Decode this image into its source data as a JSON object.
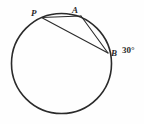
{
  "figure": {
    "background_color": "#fefefe",
    "stroke_color": "#2b2b2b",
    "circle": {
      "name": "main-circle",
      "center_x": 61.5,
      "center_y": 63.5,
      "radius": 50,
      "stroke_width": 1.6
    },
    "points": [
      {
        "id": "P",
        "label": "P",
        "x": 41.5,
        "y": 17.5,
        "label_x": 31,
        "label_y": 9
      },
      {
        "id": "A",
        "label": "A",
        "x": 81.0,
        "y": 16.0,
        "label_x": 72,
        "label_y": 6
      },
      {
        "id": "B",
        "label": "B",
        "x": 108.0,
        "y": 53.0,
        "label_x": 111,
        "label_y": 49
      }
    ],
    "chords": [
      {
        "name": "chord-p-a",
        "from": "P",
        "to": "A",
        "stroke_width": 1.1
      },
      {
        "name": "chord-p-b",
        "from": "P",
        "to": "B",
        "stroke_width": 1.1
      },
      {
        "name": "chord-a-b",
        "from": "A",
        "to": "B",
        "stroke_width": 1.1
      }
    ],
    "annotations": [
      {
        "name": "angle-measure-b",
        "text": "30°",
        "value": 30,
        "unit": "degrees",
        "x": 122,
        "y": 46
      }
    ]
  }
}
